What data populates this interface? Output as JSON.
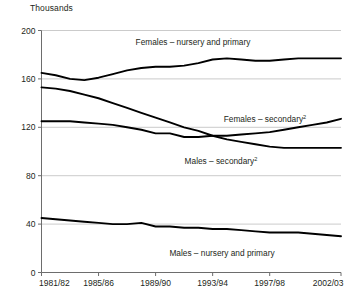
{
  "chart_data": {
    "type": "line",
    "title": "",
    "subtitle": "",
    "ylabel": "Thousands",
    "xlabel": "",
    "ylim": [
      0,
      200
    ],
    "yticks": [
      0,
      40,
      80,
      120,
      160,
      200
    ],
    "ytick_labels": [
      "0",
      "40",
      "80",
      "120",
      "160",
      "200"
    ],
    "grid": "horizontal",
    "legend_position": "inline-annotations",
    "x": [
      "1981/82",
      "1982/83",
      "1983/84",
      "1984/85",
      "1985/86",
      "1986/87",
      "1987/88",
      "1988/89",
      "1989/90",
      "1990/91",
      "1991/92",
      "1992/93",
      "1993/94",
      "1994/95",
      "1995/96",
      "1996/97",
      "1997/98",
      "1998/99",
      "1999/00",
      "2000/01",
      "2001/02",
      "2002/03"
    ],
    "xtick_labels": [
      "1981/82",
      "1985/86",
      "1989/90",
      "1993/94",
      "1997/98",
      "2002/03"
    ],
    "xtick_positions": [
      0,
      4,
      8,
      12,
      16,
      21
    ],
    "series": [
      {
        "name": "Females – nursery and primary",
        "label": "Females – nursery and primary",
        "superscript": "",
        "color": "#000000",
        "values": [
          165,
          163,
          160,
          159,
          161,
          164,
          167,
          169,
          170,
          170,
          171,
          173,
          176,
          177,
          176,
          175,
          175,
          176,
          177,
          177,
          177,
          177
        ]
      },
      {
        "name": "Males – secondary",
        "label": "Males – secondary",
        "superscript": "2",
        "color": "#000000",
        "values": [
          153,
          152,
          150,
          147,
          144,
          140,
          136,
          132,
          128,
          124,
          120,
          117,
          113,
          110,
          108,
          106,
          104,
          103,
          103,
          103,
          103,
          103
        ]
      },
      {
        "name": "Females – secondary",
        "label": "Females – secondary",
        "superscript": "2",
        "color": "#000000",
        "values": [
          125,
          125,
          125,
          124,
          123,
          122,
          120,
          118,
          115,
          115,
          112,
          112,
          113,
          113,
          114,
          115,
          116,
          118,
          120,
          122,
          124,
          127
        ]
      },
      {
        "name": "Males – nursery and primary",
        "label": "Males – nursery and primary",
        "superscript": "",
        "color": "#000000",
        "values": [
          45,
          44,
          43,
          42,
          41,
          40,
          40,
          41,
          38,
          38,
          37,
          37,
          36,
          36,
          35,
          34,
          33,
          33,
          33,
          32,
          31,
          30
        ]
      }
    ]
  },
  "annotations": {
    "females_nursery": {
      "text": "Females – nursery and primary",
      "sup": ""
    },
    "females_secondary": {
      "text": "Females – secondary",
      "sup": "2"
    },
    "males_secondary": {
      "text": "Males – secondary",
      "sup": "2"
    },
    "males_nursery": {
      "text": "Males – nursery and primary",
      "sup": ""
    }
  },
  "axis": {
    "unit_label": "Thousands"
  }
}
